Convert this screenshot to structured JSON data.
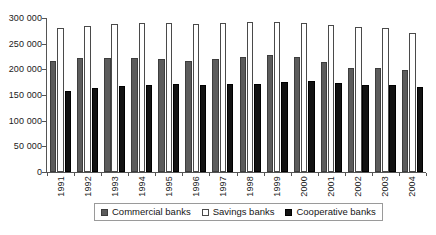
{
  "chart_data": {
    "type": "bar",
    "title": "",
    "xlabel": "",
    "ylabel": "",
    "ylim": [
      0,
      300000
    ],
    "ytick_values": [
      0,
      50000,
      100000,
      150000,
      200000,
      250000,
      300000
    ],
    "ytick_labels": [
      "0",
      "50 000",
      "100 000",
      "150 000",
      "200 000",
      "250 000",
      "300 000"
    ],
    "grid": false,
    "legend_position": "bottom",
    "categories": [
      "1991",
      "1992",
      "1993",
      "1994",
      "1995",
      "1996",
      "1997",
      "1998",
      "1999",
      "2000",
      "2001",
      "2002",
      "2003",
      "2004"
    ],
    "series": [
      {
        "name": "Commercial banks",
        "color": "#5c5c5c",
        "values": [
          216000,
          222000,
          222000,
          223000,
          221000,
          217000,
          221000,
          225000,
          227000,
          225000,
          215000,
          202000,
          203000,
          198000
        ]
      },
      {
        "name": "Savings banks",
        "color": "#ffffff",
        "values": [
          281000,
          285000,
          288000,
          291000,
          291000,
          289000,
          291000,
          293000,
          292000,
          290000,
          287000,
          283000,
          281000,
          270000
        ]
      },
      {
        "name": "Cooperative banks",
        "color": "#121212",
        "values": [
          157000,
          164000,
          167000,
          170000,
          171000,
          170000,
          172000,
          172000,
          175000,
          177000,
          173000,
          170000,
          170000,
          166000
        ]
      }
    ]
  },
  "legend": {
    "items": [
      {
        "label": "Commercial banks",
        "swatch": "commercial"
      },
      {
        "label": "Savings banks",
        "swatch": "savings"
      },
      {
        "label": "Cooperative banks",
        "swatch": "cooperative"
      }
    ]
  }
}
